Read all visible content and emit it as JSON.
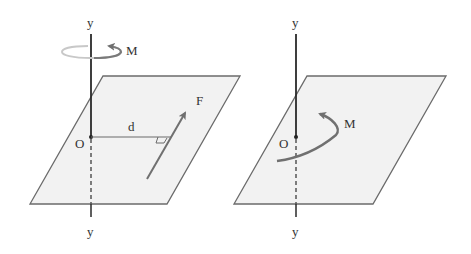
{
  "figures": [
    {
      "id": "left",
      "description": "Force F at distance d from axis y-y produces moment M about axis",
      "labels": {
        "axis_top": "y",
        "axis_bottom": "y",
        "origin": "O",
        "distance": "d",
        "force": "F",
        "moment": "M"
      }
    },
    {
      "id": "right",
      "description": "Equivalent moment M acting in plane about axis y-y through O",
      "labels": {
        "axis_top": "y",
        "axis_bottom": "y",
        "origin": "O",
        "moment": "M"
      }
    }
  ],
  "colors": {
    "plane_fill": "#f2f2f2",
    "plane_stroke": "#6b6b6b",
    "axis": "#2a2a2a",
    "arrow": "#777777",
    "text": "#333333"
  }
}
